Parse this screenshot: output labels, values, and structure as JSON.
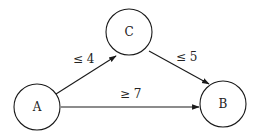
{
  "nodes": [
    {
      "id": "A",
      "label": "A",
      "cx": 37,
      "cy": 107,
      "r": 23
    },
    {
      "id": "C",
      "label": "C",
      "cx": 129,
      "cy": 32,
      "r": 23
    },
    {
      "id": "B",
      "label": "B",
      "cx": 223,
      "cy": 104,
      "r": 23
    }
  ],
  "edges": [
    {
      "from": "A",
      "to": "C",
      "label": "≤ 4"
    },
    {
      "from": "C",
      "to": "B",
      "label": "≤ 5"
    },
    {
      "from": "A",
      "to": "B",
      "label": "≥ 7"
    }
  ]
}
